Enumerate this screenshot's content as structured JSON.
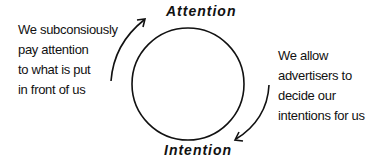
{
  "diagram": {
    "top_label": "Attention",
    "bottom_label": "Intention",
    "left_note": [
      "We subconsiously",
      "pay attention",
      "to what is put",
      "in front of us"
    ],
    "right_note": [
      "We allow",
      "advertisers to",
      "decide our",
      "intentions for us"
    ],
    "colors": {
      "stroke": "#111111",
      "background": "#ffffff"
    }
  }
}
